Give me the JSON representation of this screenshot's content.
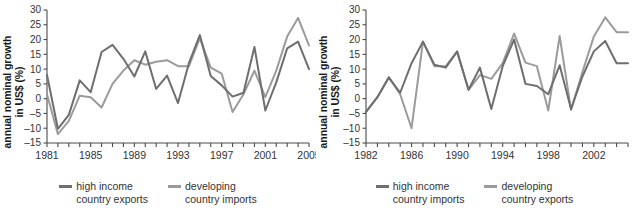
{
  "chart_data": [
    {
      "type": "line",
      "panel": "left",
      "title": "",
      "xlabel": "",
      "ylabel": "annual nominal growth in US$ (%)",
      "ylabel_line1": "annual nominal growth",
      "ylabel_line2": "in US$ (%)",
      "ylim": [
        -15,
        30
      ],
      "yticks": [
        -15,
        -10,
        -5,
        0,
        5,
        10,
        15,
        20,
        25,
        30
      ],
      "ytick_labels": [
        "–15",
        "–10",
        "–5",
        "0",
        "5",
        "10",
        "15",
        "20",
        "25",
        "30"
      ],
      "xlim": [
        1981,
        2005
      ],
      "xticks": [
        1981,
        1982,
        1983,
        1984,
        1985,
        1986,
        1987,
        1988,
        1989,
        1990,
        1991,
        1992,
        1993,
        1994,
        1995,
        1996,
        1997,
        1998,
        1999,
        2000,
        2001,
        2002,
        2003,
        2004,
        2005
      ],
      "xtick_labels_shown": [
        "1981",
        "1985",
        "1989",
        "1993",
        "1997",
        "2001",
        "2005"
      ],
      "grid": false,
      "legend_position": "bottom",
      "x": [
        1981,
        1982,
        1983,
        1984,
        1985,
        1986,
        1987,
        1988,
        1989,
        1990,
        1991,
        1992,
        1993,
        1994,
        1995,
        1996,
        1997,
        1998,
        1999,
        2000,
        2001,
        2002,
        2003,
        2004,
        2005
      ],
      "series": [
        {
          "name": "high income country exports",
          "color": "#6e6e6e",
          "values": [
            8,
            -10.2,
            -5.5,
            6.2,
            2.2,
            15.8,
            18.2,
            13.5,
            7.5,
            16,
            3.3,
            7.8,
            -1.5,
            12,
            21.5,
            7.7,
            4.5,
            0.7,
            2,
            17.5,
            -4,
            5.5,
            17,
            19.3,
            10
          ]
        },
        {
          "name": "developing country imports",
          "color": "#9b9b9b",
          "values": [
            1.5,
            -12,
            -7.5,
            1,
            0.5,
            -3,
            5,
            9.5,
            13,
            11.5,
            12.5,
            13,
            11,
            11,
            20.5,
            10.5,
            8.5,
            -4.5,
            1.5,
            9.5,
            0.5,
            9.5,
            21,
            27.3,
            18
          ]
        }
      ],
      "legend": [
        {
          "label_line1": "high income",
          "label_line2": "country exports",
          "color": "#6e6e6e"
        },
        {
          "label_line1": "developing",
          "label_line2": "country imports",
          "color": "#9b9b9b"
        }
      ]
    },
    {
      "type": "line",
      "panel": "right",
      "title": "",
      "xlabel": "",
      "ylabel": "annual nominal growth in US$ (%)",
      "ylabel_line1": "annual nominal growth",
      "ylabel_line2": "in US$ (%)",
      "ylim": [
        -15,
        30
      ],
      "yticks": [
        -15,
        -10,
        -5,
        0,
        5,
        10,
        15,
        20,
        25,
        30
      ],
      "ytick_labels": [
        "–15",
        "–10",
        "–5",
        "0",
        "5",
        "10",
        "15",
        "20",
        "25",
        "30"
      ],
      "xlim": [
        1982,
        2005
      ],
      "xticks": [
        1982,
        1983,
        1984,
        1985,
        1986,
        1987,
        1988,
        1989,
        1990,
        1991,
        1992,
        1993,
        1994,
        1995,
        1996,
        1997,
        1998,
        1999,
        2000,
        2001,
        2002,
        2003,
        2004,
        2005
      ],
      "xtick_labels_shown": [
        "1982",
        "1986",
        "1990",
        "1994",
        "1998",
        "2002"
      ],
      "grid": false,
      "legend_position": "bottom",
      "x": [
        1982,
        1983,
        1984,
        1985,
        1986,
        1987,
        1988,
        1989,
        1990,
        1991,
        1992,
        1993,
        1994,
        1995,
        1996,
        1997,
        1998,
        1999,
        2000,
        2001,
        2002,
        2003,
        2004,
        2005
      ],
      "series": [
        {
          "name": "high income country imports",
          "color": "#6e6e6e",
          "values": [
            -4.5,
            0.5,
            7.2,
            2,
            12,
            19.3,
            11.5,
            10.5,
            16,
            3,
            10.5,
            -3.5,
            11,
            20,
            5,
            4.3,
            1.5,
            11.3,
            -3.5,
            7.5,
            16,
            19.5,
            12,
            12
          ]
        },
        {
          "name": "developing country exports",
          "color": "#9b9b9b",
          "values": [
            -4.5,
            0.5,
            7.2,
            1.5,
            -10,
            19.3,
            11,
            11,
            15.8,
            3,
            8,
            6.7,
            12,
            22,
            12.2,
            11,
            -4,
            21.2,
            -3.8,
            9,
            21,
            27.5,
            22.5,
            22.5
          ]
        }
      ],
      "legend": [
        {
          "label_line1": "high income",
          "label_line2": "country imports",
          "color": "#6e6e6e"
        },
        {
          "label_line1": "developing",
          "label_line2": "country exports",
          "color": "#9b9b9b"
        }
      ]
    }
  ],
  "style": {
    "axis_color": "#4a4a4a",
    "tick_label_color": "#333333",
    "background": "#ffffff"
  }
}
